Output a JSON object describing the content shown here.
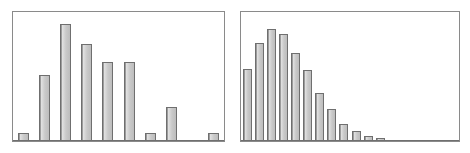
{
  "figure": {
    "background_color": "#ffffff",
    "frame_color": "#8a8a8a",
    "bar_fill_color": "#c9c9c9",
    "bar_edge_color": "#6f6f6f",
    "panel_count": 2
  },
  "chart_data": [
    {
      "type": "bar",
      "title": "",
      "subtitle": "",
      "xlabel": "",
      "ylabel": "",
      "panel": "left",
      "grid": false,
      "legend": "none",
      "axis_ticks_visible": false,
      "tick_labels_visible": false,
      "categories": [
        "1",
        "2",
        "3",
        "4",
        "5",
        "6",
        "7",
        "8",
        "9",
        "10"
      ],
      "values": [
        6,
        52,
        92,
        76,
        62,
        62,
        6,
        27,
        0,
        6
      ],
      "ylim": [
        0,
        100
      ],
      "xlim": [
        0,
        10
      ],
      "bar_width_frac": 0.5,
      "description": "irregular multimodal distribution"
    },
    {
      "type": "bar",
      "title": "",
      "subtitle": "",
      "xlabel": "",
      "ylabel": "",
      "panel": "right",
      "grid": false,
      "legend": "none",
      "axis_ticks_visible": false,
      "tick_labels_visible": false,
      "categories": [
        "1",
        "2",
        "3",
        "4",
        "5",
        "6",
        "7",
        "8",
        "9",
        "10",
        "11",
        "12",
        "13",
        "14",
        "15",
        "16",
        "17",
        "18"
      ],
      "values": [
        57,
        77,
        88,
        84,
        69,
        56,
        38,
        25,
        13,
        8,
        4,
        2,
        1,
        1,
        0,
        0,
        0,
        0
      ],
      "ylim": [
        0,
        100
      ],
      "xlim": [
        0,
        18
      ],
      "bar_width_frac": 0.72,
      "description": "right-skewed unimodal distribution with long tail"
    }
  ]
}
